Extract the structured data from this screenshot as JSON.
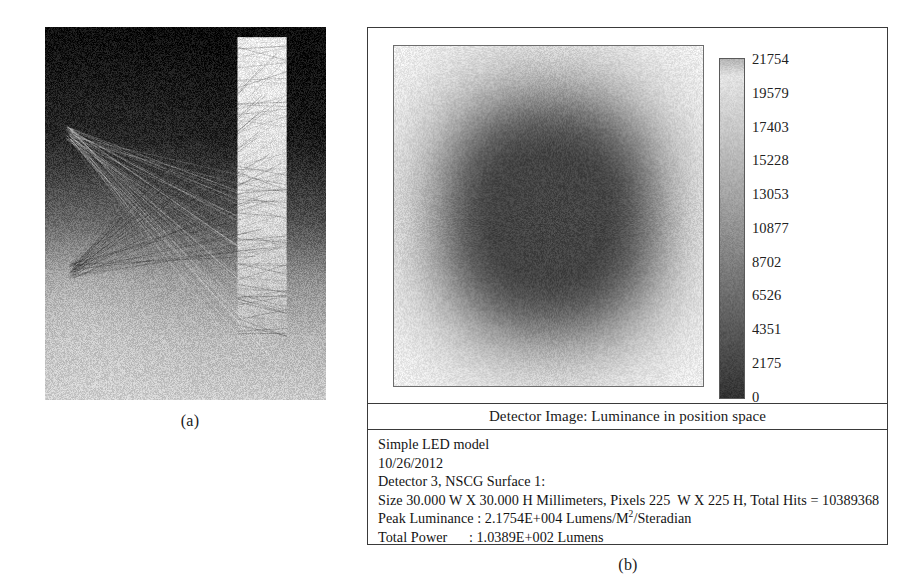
{
  "figure": {
    "panel_a": {
      "caption": "(a)",
      "description": "Ray-trace rendering: LED sources and illuminated detector strip"
    },
    "panel_b": {
      "caption": "(b)",
      "detector_title": "Detector Image: Luminance in position space",
      "info_lines": [
        "Simple LED model",
        "10/26/2012",
        "Detector 3, NSCG Surface 1:",
        "Size 30.000 W X 30.000 H Millimeters, Pixels 225  W X 225 H, Total Hits = 10389368",
        "Peak Luminance : 2.1754E+004 Lumens/M2/Steradian",
        "Total Power      : 1.0389E+002 Lumens"
      ],
      "info_lines_rich": [
        {
          "text": "Simple LED model"
        },
        {
          "text": "10/26/2012"
        },
        {
          "text": "Detector 3, NSCG Surface 1:"
        },
        {
          "text": "Size 30.000 W X 30.000 H Millimeters, Pixels 225  W X 225 H, Total Hits = 10389368"
        },
        {
          "prefix": "Peak Luminance : 2.1754E+004 Lumens/M",
          "sup": "2",
          "suffix": "/Steradian"
        },
        {
          "text": "Total Power      : 1.0389E+002 Lumens"
        }
      ],
      "model_name": "Simple LED model",
      "date": "10/26/2012",
      "detector_id": "Detector 3, NSCG Surface 1:",
      "size_line": "Size 30.000 W X 30.000 H Millimeters, Pixels 225  W X 225 H, Total Hits = 10389368",
      "peak_luminance_label": "Peak Luminance : ",
      "peak_luminance_value": "2.1754E+004",
      "peak_luminance_units_base": " Lumens/M",
      "peak_luminance_units_sup": "2",
      "peak_luminance_units_tail": "/Steradian",
      "total_power_label": "Total Power      : ",
      "total_power_value": "1.0389E+002",
      "total_power_units": " Lumens",
      "size_w_mm": "30.000",
      "size_h_mm": "30.000",
      "pixels_w": "225",
      "pixels_h": "225",
      "total_hits": "10389368"
    }
  },
  "chart_data": {
    "type": "heatmap",
    "title": "Detector Image: Luminance in position space",
    "xlabel": "",
    "ylabel": "",
    "units": "Lumens/M2/Steradian",
    "grid": false,
    "legend_position": "right",
    "colorbar": {
      "orientation": "vertical",
      "colormap": "grayscale-inverted",
      "min": 0,
      "max": 21754,
      "ticks": [
        21754,
        19579,
        17403,
        15228,
        13053,
        10877,
        8702,
        6526,
        4351,
        2175,
        0
      ],
      "tick_labels": [
        "21754",
        "19579",
        "17403",
        "15228",
        "13053",
        "10877",
        "8702",
        "6526",
        "4351",
        "2175",
        "0"
      ]
    },
    "extent_mm": {
      "width": 30.0,
      "height": 30.0
    },
    "pixels": {
      "width": 225,
      "height": 225
    },
    "total_hits": 10389368,
    "peak_luminance": 21754,
    "total_power_lumens": 103.89,
    "distribution": "radially symmetric circular hotspot centred in the 30 x 30 mm detector, falling off to near zero at the square corners"
  },
  "colors": {
    "page_background": "#ffffff",
    "panel_border": "#3a3a3a",
    "text": "#141414",
    "colorbar_low": "#f2f2f2",
    "colorbar_high": "#303030"
  }
}
